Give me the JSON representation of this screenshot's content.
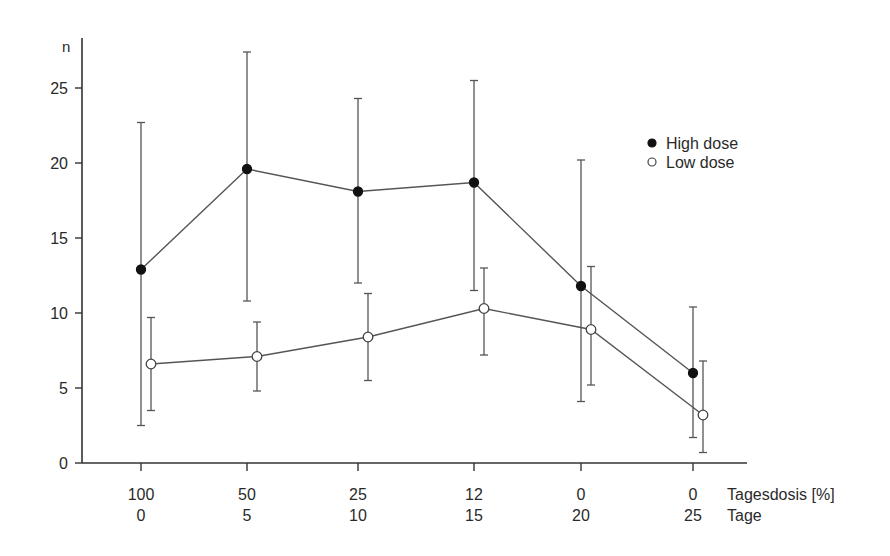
{
  "chart_data": {
    "type": "line",
    "title": "",
    "ylabel": "n",
    "ylim": [
      0,
      28
    ],
    "yticks": [
      0,
      5,
      10,
      15,
      20,
      25
    ],
    "grid": false,
    "legend_position": "right",
    "x_rows": [
      {
        "label": "Tagesdosis [%]",
        "ticks": [
          "100",
          "50",
          "25",
          "12",
          "0",
          "0"
        ]
      },
      {
        "label": "Tage",
        "ticks": [
          "0",
          "5",
          "10",
          "15",
          "20",
          "25"
        ]
      }
    ],
    "series": [
      {
        "name": "High dose",
        "marker": "filled-circle",
        "values": [
          12.9,
          19.6,
          18.1,
          18.7,
          11.8,
          6.0
        ],
        "err_upper": [
          22.7,
          27.4,
          24.3,
          25.5,
          20.2,
          10.4
        ],
        "err_lower": [
          2.5,
          10.8,
          12.0,
          11.5,
          4.1,
          1.7
        ]
      },
      {
        "name": "Low dose",
        "marker": "open-circle",
        "values": [
          6.6,
          7.1,
          8.4,
          10.3,
          8.9,
          3.2
        ],
        "err_upper": [
          9.7,
          9.4,
          11.3,
          13.0,
          13.1,
          6.8
        ],
        "err_lower": [
          3.5,
          4.8,
          5.5,
          7.2,
          5.2,
          0.7
        ]
      }
    ]
  },
  "colors": {
    "line": "#555555",
    "axis": "#333333",
    "text": "#2a2a2a"
  }
}
